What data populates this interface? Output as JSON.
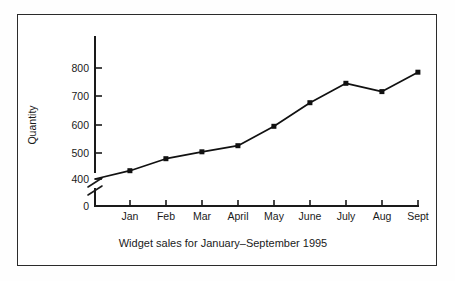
{
  "figure": {
    "caption": "Widget sales for January–September 1995",
    "background_color": "#ffffff",
    "frame_color": "#2b2b2b",
    "line_color": "#111111"
  },
  "chart_data": {
    "type": "line",
    "title": "",
    "caption": "Widget sales for January–September 1995",
    "xlabel": "",
    "ylabel": "Quantity",
    "categories": [
      "Jan",
      "Feb",
      "Mar",
      "April",
      "May",
      "June",
      "July",
      "Aug",
      "Sept"
    ],
    "values": [
      430,
      473,
      498,
      520,
      590,
      675,
      745,
      715,
      785
    ],
    "series": [
      {
        "name": "Widget sales",
        "values": [
          430,
          473,
          498,
          520,
          590,
          675,
          745,
          715,
          785
        ]
      }
    ],
    "y_ticks": [
      400,
      500,
      600,
      700,
      800
    ],
    "y_zero_tick": 0,
    "ylim": [
      400,
      850
    ],
    "axis_break": true,
    "axis_break_note": "y-axis broken between 0 and 400",
    "grid": false,
    "legend": false,
    "markers": "filled-square",
    "origin_value": 400
  }
}
